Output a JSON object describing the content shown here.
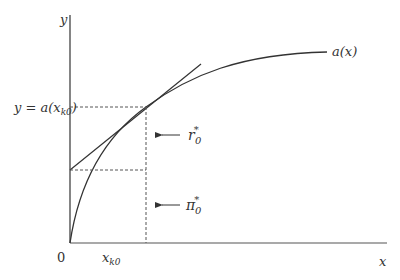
{
  "diagram": {
    "type": "economic-curve-diagram",
    "axes": {
      "y_label": "y",
      "x_label": "x",
      "origin_label": "0"
    },
    "curve": {
      "label": "a(x)",
      "description": "concave increasing function a(x) starting at origin"
    },
    "tangent_point": {
      "x_label": "x",
      "x_subscript": "k0",
      "y_label_prefix": "y = a(x",
      "y_label_subscript": "k0",
      "y_label_suffix": ")"
    },
    "annotations": [
      {
        "id": "r0",
        "symbol": "r",
        "superscript": "*",
        "subscript": "0",
        "arrow": "left"
      },
      {
        "id": "pi0",
        "symbol": "π",
        "superscript": "*",
        "subscript": "0",
        "arrow": "left"
      }
    ],
    "colors": {
      "line": "#333333",
      "dashed": "#555555",
      "background": "#ffffff"
    }
  }
}
